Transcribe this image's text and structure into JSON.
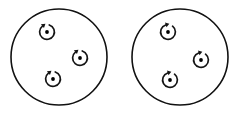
{
  "figure": {
    "background_color": "#ffffff",
    "stroke_color": "#111111",
    "vortex_stroke_color": "#141414",
    "core_color": "#000000",
    "width": 239,
    "height": 116
  },
  "chart_data": {
    "type": "scatter",
    "subtitle": "",
    "xlabel": "",
    "ylabel": "",
    "grid": false,
    "legend": "none",
    "xlim": [
      0,
      239
    ],
    "ylim": [
      0,
      116
    ],
    "domains": [
      {
        "name": "left-domain",
        "label": "",
        "center_x": 59,
        "center_y": 57,
        "radius": 48,
        "stroke_width": 1.6,
        "vortices": [
          {
            "name": "left-vortex-top",
            "x": 47,
            "y": 32,
            "ring_radius": 7.4,
            "rotation": "clockwise",
            "arrow_label": "",
            "gap_start_deg": -72,
            "gap_end_deg": 232
          },
          {
            "name": "left-vortex-right",
            "x": 80,
            "y": 58,
            "ring_radius": 7.4,
            "rotation": "clockwise",
            "arrow_label": "",
            "gap_start_deg": -72,
            "gap_end_deg": 232
          },
          {
            "name": "left-vortex-bottom",
            "x": 53,
            "y": 79,
            "ring_radius": 7.4,
            "rotation": "clockwise",
            "arrow_label": "",
            "gap_start_deg": -72,
            "gap_end_deg": 232
          }
        ]
      },
      {
        "name": "right-domain",
        "label": "",
        "center_x": 180,
        "center_y": 57,
        "radius": 48,
        "stroke_width": 1.6,
        "vortices": [
          {
            "name": "right-vortex-top",
            "x": 168,
            "y": 32,
            "ring_radius": 7.4,
            "rotation": "counter-clockwise",
            "arrow_label": "",
            "gap_start_deg": -52,
            "gap_end_deg": 252
          },
          {
            "name": "right-vortex-right",
            "x": 201,
            "y": 60,
            "ring_radius": 7.4,
            "rotation": "counter-clockwise",
            "arrow_label": "",
            "gap_start_deg": -52,
            "gap_end_deg": 252
          },
          {
            "name": "right-vortex-bottom",
            "x": 170,
            "y": 80,
            "ring_radius": 7.4,
            "rotation": "counter-clockwise",
            "arrow_label": "",
            "gap_start_deg": -52,
            "gap_end_deg": 252
          }
        ]
      }
    ]
  }
}
